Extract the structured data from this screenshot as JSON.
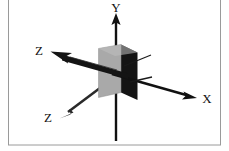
{
  "figure": {
    "background_color": "#ffffff",
    "border_color": "#9a9a9a",
    "width": 229,
    "height": 151
  },
  "labels": {
    "x_axis": "X",
    "y_axis": "Y",
    "z_axis_upper": "Z",
    "z_axis_lower": "Z"
  },
  "colors": {
    "axis_stroke": "#111111",
    "plane_front_face": "#a9a9a9",
    "plane_side_face": "#141414",
    "plane_edge": "#6e6e6e",
    "border": "#9a9a9a"
  },
  "geometry": {
    "origin": {
      "x": 116,
      "y": 75
    },
    "x_axis_tip": {
      "x": 196,
      "y": 97
    },
    "y_axis_tip": {
      "x": 116,
      "y": 14
    },
    "y_axis_base": {
      "x": 116,
      "y": 141
    },
    "z_upper_tip": {
      "x": 53,
      "y": 59
    },
    "z_lower_tip": {
      "x": 62,
      "y": 115
    },
    "plane_front_quad": "99,49 116,44 116,92 99,97",
    "plane_front_quad_wide": "99,49 122,44 122,92 99,97",
    "plane_dark_quad": "122,44 137,52 137,99 122,92"
  },
  "elements": {
    "x_arrow_name": "x-axis-arrow",
    "y_arrow_name": "y-axis-arrow",
    "z_upper_arrow_name": "z-axis-upper-arrow",
    "z_lower_arrow_name": "z-axis-lower-arrow",
    "plane_name": "origin-plane"
  }
}
